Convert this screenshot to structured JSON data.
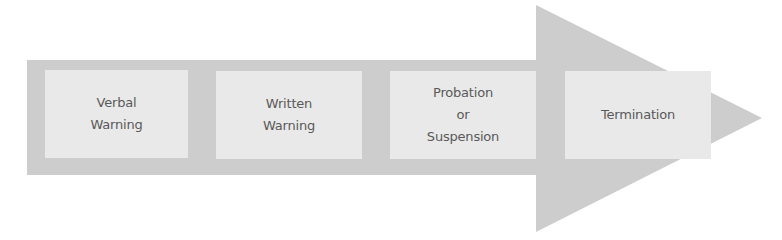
{
  "diagram": {
    "type": "process-arrow",
    "colors": {
      "arrow_fill": "#cdcdcd",
      "box_fill": "#e9e9e9",
      "text": "#595959",
      "background": "#ffffff"
    },
    "steps": [
      {
        "label": "Verbal\nWarning"
      },
      {
        "label": "Written\nWarning"
      },
      {
        "label": "Probation\nor\nSuspension"
      },
      {
        "label": "Termination"
      }
    ]
  }
}
